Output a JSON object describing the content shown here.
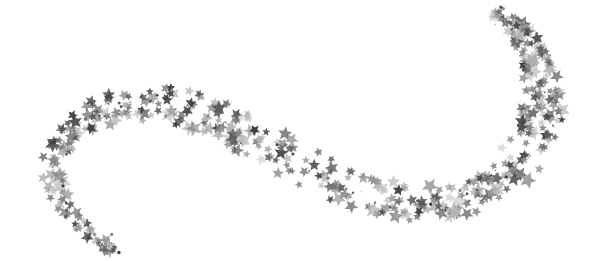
{
  "image": {
    "description": "Silver glitter stars arranged in a flowing S-shaped wave on a white background",
    "background_color": "#ffffff",
    "subject": "star trail wave"
  },
  "stars": {
    "tones": [
      "#3a3a3a",
      "#4d4d4d",
      "#5e5e5e",
      "#707070",
      "#858585",
      "#9a9a9a",
      "#b0b0b0",
      "#c4c4c4"
    ],
    "count": 520,
    "seed": 7
  },
  "trail": {
    "path_normalized": [
      [
        0.19,
        0.96
      ],
      [
        0.13,
        0.85
      ],
      [
        0.09,
        0.7
      ],
      [
        0.1,
        0.56
      ],
      [
        0.15,
        0.45
      ],
      [
        0.24,
        0.4
      ],
      [
        0.32,
        0.42
      ],
      [
        0.4,
        0.5
      ],
      [
        0.5,
        0.62
      ],
      [
        0.6,
        0.73
      ],
      [
        0.7,
        0.78
      ],
      [
        0.78,
        0.76
      ],
      [
        0.85,
        0.66
      ],
      [
        0.9,
        0.52
      ],
      [
        0.91,
        0.38
      ],
      [
        0.9,
        0.24
      ],
      [
        0.87,
        0.12
      ],
      [
        0.83,
        0.04
      ]
    ]
  }
}
